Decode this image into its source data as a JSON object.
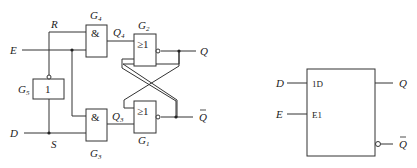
{
  "circuit": {
    "inputs": {
      "E": "E",
      "D": "D"
    },
    "nodes": {
      "R": "R",
      "S": "S",
      "Q4": "Q",
      "Q4_sub": "4",
      "Q3": "Q",
      "Q3_sub": "3"
    },
    "outputs": {
      "Q": "Q",
      "Qbar": "Q"
    },
    "gates": [
      {
        "id": "G4",
        "name": "G",
        "sub": "4",
        "symbol": "&"
      },
      {
        "id": "G3",
        "name": "G",
        "sub": "3",
        "symbol": "&"
      },
      {
        "id": "G2",
        "name": "G",
        "sub": "2",
        "symbol": "≥1"
      },
      {
        "id": "G1",
        "name": "G",
        "sub": "1",
        "symbol": "≥1"
      },
      {
        "id": "G5",
        "name": "G",
        "sub": "5",
        "symbol": "1"
      }
    ]
  },
  "symbol_block": {
    "inputs": [
      {
        "pin": "D",
        "label": "1D"
      },
      {
        "pin": "E",
        "label": "E1"
      }
    ],
    "outputs": [
      {
        "pin": "Q"
      },
      {
        "pin": "Q",
        "inverted": true
      }
    ]
  }
}
